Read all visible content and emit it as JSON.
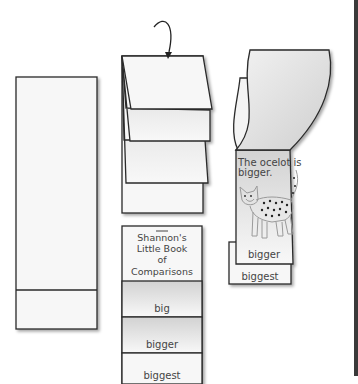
{
  "figure": {
    "step1": {
      "label": "blank-strip"
    },
    "step2": {
      "label": "folded-strip",
      "arrow": "fold-down-arrow"
    },
    "step3": {
      "page_text_line1": "The ocelot is",
      "page_text_line2": "bigger.",
      "flap_label": "bigger",
      "bottom_label": "biggest"
    },
    "step4": {
      "title_line1": "Shannon's",
      "title_line2": "Little Book",
      "title_line3": "of",
      "title_line4": "Comparisons",
      "flaps": [
        "big",
        "bigger",
        "biggest"
      ]
    }
  },
  "colors": {
    "outline": "#2a2a2a",
    "paper": "#f7f7f7",
    "shade": "#d6d6d6",
    "text": "#444444",
    "cat_line": "#9a9a9a"
  }
}
